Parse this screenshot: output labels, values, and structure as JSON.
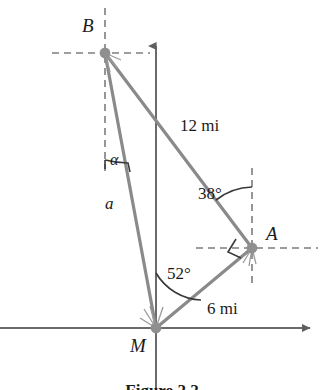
{
  "figure": {
    "caption": "Figure 2.2",
    "colors": {
      "ray": "#8a8a8a",
      "axis": "#6b6b6b",
      "dash": "#7d7d7d",
      "arc": "#3a3a3a",
      "text": "#1a1a1a",
      "vertex_dot": "#8f8f8f",
      "background": "#ffffff"
    },
    "points": [
      {
        "name": "B",
        "label": "B",
        "x": 105,
        "y": 53
      },
      {
        "name": "A",
        "label": "A",
        "x": 252,
        "y": 248
      },
      {
        "name": "M",
        "label": "M",
        "x": 156,
        "y": 328
      }
    ],
    "segments": [
      {
        "name": "segment-BA",
        "from": "B",
        "to": "A",
        "label": "12 mi"
      },
      {
        "name": "segment-MA",
        "from": "M",
        "to": "A",
        "label": "6 mi"
      },
      {
        "name": "segment-MB",
        "from": "M",
        "to": "B",
        "label": "a"
      }
    ],
    "angles": [
      {
        "name": "angle-alpha-at-B",
        "label": "α",
        "vertex": "B"
      },
      {
        "name": "angle-38-at-A",
        "label": "38°",
        "value": 38,
        "vertex": "A"
      },
      {
        "name": "angle-52-at-M",
        "label": "52°",
        "value": 52,
        "vertex": "M"
      },
      {
        "name": "right-angle-at-A",
        "label": "",
        "vertex": "A"
      }
    ],
    "labels": {
      "point_b": "B",
      "point_a": "A",
      "point_m": "M",
      "side_a": "a",
      "alpha": "α",
      "len_ba": "12 mi",
      "len_ma": "6 mi",
      "angle_38": "38°",
      "angle_52": "52°"
    },
    "axes": {
      "vertical_name": "vertical-axis",
      "horizontal_name": "horizontal-axis"
    }
  }
}
